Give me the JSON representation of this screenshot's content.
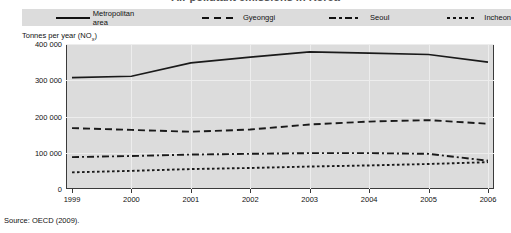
{
  "figure": {
    "title_cropped": "Air pollutant emissions in Korea",
    "source": "Source:  OECD (2009)."
  },
  "legend": {
    "position": "top",
    "entries": [
      {
        "label": "Metropolitan area",
        "style": "solid",
        "key": "solid-line-key"
      },
      {
        "label": "Gyeonggi",
        "style": "dashed",
        "key": "dashed-line-key"
      },
      {
        "label": "Seoul",
        "style": "dashdot",
        "key": "dash-dot-line-key"
      },
      {
        "label": "Incheon",
        "style": "dotted",
        "key": "dotted-line-key"
      }
    ]
  },
  "axes": {
    "ylabel_main": "Tonnes per year (NO",
    "ylabel_sub": "x",
    "ylabel_close": ")",
    "yticks": [
      "400 000",
      "300 000",
      "200 000",
      "100 000",
      "0"
    ],
    "xticks": [
      "1999",
      "2000",
      "2001",
      "2002",
      "2003",
      "2004",
      "2005",
      "2006"
    ]
  },
  "colors": {
    "plot_background": "#dcdcdc",
    "legend_background": "#dcdcdc",
    "line": "#1a1a1a",
    "gridline": "#ededed",
    "axis": "#3a3a3a",
    "page_background": "#ffffff"
  },
  "chart_data": {
    "type": "line",
    "title": "Air pollutant emissions in Korea",
    "xlabel": "",
    "ylabel": "Tonnes per year (NOx)",
    "ylim": [
      0,
      400000
    ],
    "ytick_values": [
      0,
      100000,
      200000,
      300000,
      400000
    ],
    "grid": true,
    "legend_position": "top",
    "x": [
      1999,
      2000,
      2001,
      2002,
      2003,
      2004,
      2005,
      2006
    ],
    "categories": [
      "1999",
      "2000",
      "2001",
      "2002",
      "2003",
      "2004",
      "2005",
      "2006"
    ],
    "series": [
      {
        "name": "Metropolitan area",
        "style": "solid",
        "values": [
          307000,
          311000,
          348000,
          364000,
          378000,
          375000,
          371000,
          350000
        ]
      },
      {
        "name": "Gyeonggi",
        "style": "dashed",
        "values": [
          168000,
          163000,
          158000,
          164000,
          178000,
          186000,
          190000,
          180000
        ]
      },
      {
        "name": "Seoul",
        "style": "dashdot",
        "values": [
          88000,
          91000,
          95000,
          97000,
          99000,
          99000,
          97000,
          78000
        ]
      },
      {
        "name": "Incheon",
        "style": "dotted",
        "values": [
          46000,
          50000,
          55000,
          58000,
          62000,
          65000,
          69000,
          74000
        ]
      }
    ],
    "source": "OECD (2009)."
  }
}
